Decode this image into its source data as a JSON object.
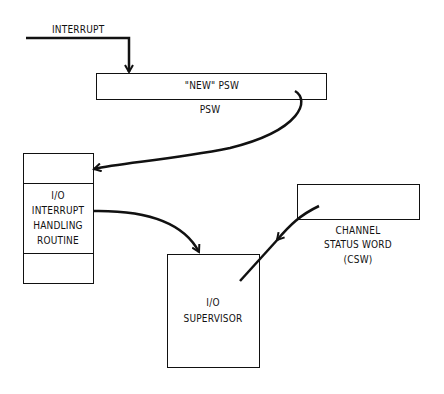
{
  "diagram": {
    "interrupt_label": "INTERRUPT",
    "new_psw_box_label": "\"NEW\" PSW",
    "psw_caption": "PSW",
    "handler_box": {
      "line1": "I/O",
      "line2": "INTERRUPT",
      "line3": "HANDLING",
      "line4": "ROUTINE"
    },
    "csw_caption": {
      "line1": "CHANNEL",
      "line2": "STATUS WORD",
      "line3": "(CSW)"
    },
    "supervisor_box": {
      "line1": "I/O",
      "line2": "SUPERVISOR"
    },
    "stroke_color": "#111111",
    "background_color": "#ffffff"
  }
}
